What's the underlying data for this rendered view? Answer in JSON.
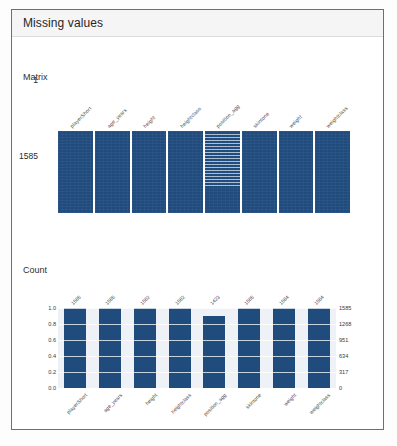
{
  "card": {
    "title": "Missing values"
  },
  "matrix": {
    "title": "Matrix",
    "columns": [
      "playerShort",
      "age_years",
      "height",
      "heightclass",
      "position_agg",
      "skintone",
      "weight",
      "weightclass"
    ],
    "sparse_column_index": 4,
    "y_top": "1",
    "y_bottom": "1585"
  },
  "count": {
    "title": "Count"
  },
  "chart_data": [
    {
      "type": "heatmap",
      "title": "Matrix",
      "xlabel": "",
      "ylabel": "",
      "categories": [
        "playerShort",
        "age_years",
        "height",
        "heightclass",
        "position_agg",
        "skintone",
        "weight",
        "weightclass"
      ],
      "y_range": [
        1,
        1585
      ],
      "y_tick_labels": [
        "1",
        "1585"
      ],
      "grid": false,
      "legend": "none",
      "notes": "Dark navy = present values; white horizontal streaks = missing values. Only column 'position_agg' shows substantial missing data in the upper ~65% of rows.",
      "values_present_fraction": [
        1.0,
        1.0,
        1.0,
        1.0,
        0.9,
        1.0,
        1.0,
        1.0
      ]
    },
    {
      "type": "bar",
      "title": "Count",
      "xlabel": "",
      "ylabel": "",
      "categories": [
        "playerShort",
        "age_years",
        "height",
        "heightclass",
        "position_agg",
        "skintone",
        "weight",
        "weightclass"
      ],
      "values": [
        1.0,
        1.0,
        1.0,
        1.0,
        0.9,
        1.0,
        1.0,
        1.0
      ],
      "counts": [
        1585,
        1585,
        1582,
        1582,
        1423,
        1585,
        1584,
        1584
      ],
      "bar_labels": [
        "1585",
        "1585",
        "1582",
        "1582",
        "1423",
        "1585",
        "1584",
        "1584"
      ],
      "ylim": [
        0.0,
        1.0
      ],
      "y_tick_labels_left": [
        "1.0",
        "0.8",
        "0.6",
        "0.4",
        "0.2",
        "0.0"
      ],
      "y_tick_values_left": [
        1.0,
        0.8,
        0.6,
        0.4,
        0.2,
        0.0
      ],
      "y_tick_labels_right": [
        "1585",
        "1268",
        "951",
        "634",
        "317",
        "0"
      ],
      "y_tick_values_right": [
        1585,
        1268,
        951,
        634,
        317,
        0
      ],
      "grid": true,
      "legend": "none",
      "bar_color": "#1f4b7d",
      "plot_background": "#eef2f7"
    }
  ],
  "colors": {
    "bar": "#1f4b7d",
    "plot_bg": "#eef2f7",
    "card_header_bg": "#f5f5f5",
    "card_border": "#6f6f6f"
  }
}
